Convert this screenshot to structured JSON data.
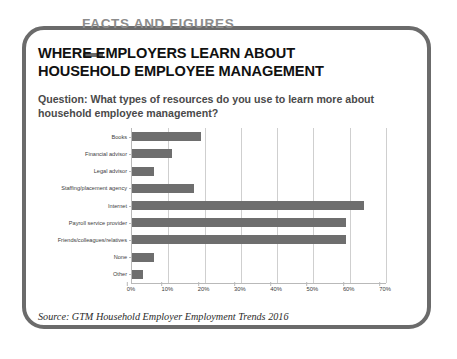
{
  "banner": {
    "label": "FACTS AND FIGURES"
  },
  "title": "WHERE EMPLOYERS LEARN ABOUT HOUSEHOLD EMPLOYEE MANAGEMENT",
  "question": "Question: What types of resources do you use to learn more about household employee management?",
  "source": "Source: GTM Household Employer Employment Trends 2016",
  "colors": {
    "bar": "#6e6e6e",
    "frame": "#6b6b6b",
    "banner_text": "#8c8c8c",
    "grid": "#cfcfcf",
    "axis": "#b9b9b9"
  },
  "chart_data": {
    "type": "bar",
    "orientation": "horizontal",
    "title": "WHERE EMPLOYERS LEARN ABOUT HOUSEHOLD EMPLOYEE MANAGEMENT",
    "subtitle": "Question: What types of resources do you use to learn more about household employee management?",
    "categories": [
      "Books",
      "Financial advisor",
      "Legal advisor",
      "Staffing/placement agency",
      "Internet",
      "Payroll service provider",
      "Friends/colleagues/relatives",
      "None",
      "Other"
    ],
    "values": [
      19,
      11,
      6,
      17,
      64,
      59,
      59,
      6,
      3
    ],
    "xlabel": "",
    "ylabel": "",
    "xlim": [
      0,
      70
    ],
    "xticks": [
      0,
      10,
      20,
      30,
      40,
      50,
      60,
      70
    ],
    "xtick_labels": [
      "0%",
      "10%",
      "20%",
      "30%",
      "40%",
      "50%",
      "60%",
      "70%"
    ],
    "grid": true,
    "legend": false,
    "series": [
      {
        "name": "Share of employers",
        "values": [
          19,
          11,
          6,
          17,
          64,
          59,
          59,
          6,
          3
        ]
      }
    ]
  }
}
